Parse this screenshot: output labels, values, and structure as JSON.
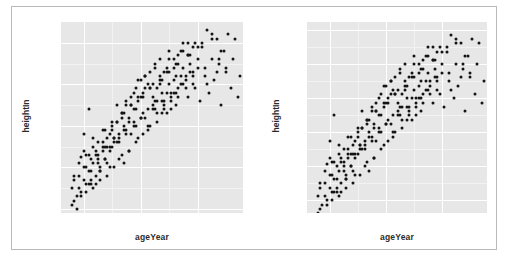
{
  "figure": {
    "background": "#ffffff",
    "border_color": "#b9b9b9",
    "panel_fill": "#e7e7e7",
    "grid_color": "#ffffff",
    "point_color": "#141414"
  },
  "chart_data": [
    {
      "type": "scatter",
      "title": "",
      "xlabel": "ageYear",
      "ylabel": "heightIn",
      "xlim": [
        11.2,
        17.6
      ],
      "ylim": [
        49.5,
        72.5
      ],
      "xticks": [
        12,
        14,
        16
      ],
      "xtick_labels": [
        "12",
        "14",
        "16"
      ],
      "yticks": [
        50,
        55,
        60,
        65,
        70
      ],
      "ytick_labels": [
        "4'2\"",
        "4'7\"",
        "5'0\"",
        "5'5\"",
        "5'10\""
      ],
      "grid": true,
      "legend": "none",
      "x": [
        11.92,
        12.0,
        12.08,
        12.17,
        12.25,
        12.33,
        12.42,
        12.5,
        12.58,
        12.67,
        12.75,
        12.83,
        12.92,
        13.0,
        13.08,
        13.17,
        13.25,
        13.33,
        13.42,
        13.5,
        13.58,
        13.67,
        13.75,
        13.83,
        13.92,
        14.0,
        14.08,
        14.17,
        14.25,
        14.33,
        14.42,
        14.5,
        14.58,
        14.67,
        14.75,
        14.83,
        14.92,
        15.0,
        15.08,
        15.17,
        15.25,
        15.33,
        15.42,
        15.5,
        15.58,
        15.67,
        15.75,
        15.83,
        15.92,
        16.0,
        16.08,
        16.17,
        16.25,
        16.33,
        16.42,
        16.5,
        16.58,
        16.67,
        16.75,
        16.83,
        16.92,
        17.0,
        17.08,
        17.17,
        17.25,
        17.33,
        17.42,
        17.5,
        11.58,
        11.67,
        11.75,
        11.83,
        11.92,
        12.0,
        12.08,
        12.17,
        12.25,
        12.33,
        12.42,
        12.5,
        12.58,
        12.67,
        12.75,
        12.83,
        12.92,
        13.0,
        13.08,
        13.17,
        13.25,
        13.33,
        13.42,
        13.5,
        13.58,
        13.67,
        13.75,
        13.83,
        13.92,
        14.0,
        14.08,
        14.17,
        14.25,
        14.33,
        14.42,
        14.5,
        14.58,
        14.67,
        14.75,
        14.83,
        14.92,
        15.0,
        15.08,
        15.17,
        15.25,
        15.33,
        15.42,
        15.5,
        15.58,
        15.67,
        15.75,
        15.83,
        11.58,
        11.67,
        11.75,
        11.83,
        11.92,
        12.0,
        12.08,
        12.17,
        12.25,
        12.33,
        12.42,
        12.5,
        12.58,
        12.67,
        12.75,
        12.83,
        12.92,
        13.0,
        13.08,
        13.17,
        13.25,
        13.33,
        13.42,
        13.5,
        13.58,
        13.67,
        13.75,
        13.83,
        13.92,
        14.0,
        14.08,
        14.17,
        14.25,
        14.33,
        14.42,
        14.5,
        14.58,
        14.67,
        14.75,
        14.83,
        14.92,
        15.0,
        15.08,
        15.17,
        15.25,
        15.33,
        15.42,
        15.5,
        15.58,
        15.67,
        15.75,
        15.83,
        15.92,
        16.0,
        16.17,
        16.33,
        16.5,
        16.67,
        16.83,
        17.0,
        11.67,
        11.83,
        12.0,
        12.17,
        12.33,
        12.5,
        12.67,
        12.83,
        13.0,
        13.17,
        13.33,
        13.5,
        13.67,
        13.83,
        14.0,
        14.17,
        14.33,
        14.5,
        14.67,
        14.83,
        15.0,
        15.17,
        15.33,
        15.5,
        15.67,
        15.83,
        16.0,
        16.25,
        16.5,
        16.75,
        12.08,
        12.25,
        12.42,
        12.58,
        12.75,
        12.92,
        13.08,
        13.25,
        13.42,
        13.58,
        13.75,
        13.92,
        14.08,
        14.25,
        14.42,
        14.58,
        14.75,
        14.92,
        15.08,
        15.25
      ],
      "y": [
        56.3,
        59.0,
        56.5,
        62.0,
        56.0,
        57.5,
        53.0,
        58.0,
        54.5,
        57.0,
        59.5,
        55.5,
        57.5,
        60.0,
        58.5,
        62.5,
        58.0,
        61.0,
        55.5,
        63.0,
        60.5,
        59.0,
        64.0,
        62.0,
        65.5,
        61.0,
        63.5,
        66.0,
        60.0,
        64.5,
        62.5,
        67.0,
        63.0,
        65.0,
        61.5,
        66.5,
        64.0,
        68.0,
        62.0,
        65.5,
        67.5,
        63.5,
        66.0,
        69.0,
        64.5,
        68.5,
        66.5,
        65.0,
        70.0,
        67.0,
        63.0,
        69.5,
        66.0,
        71.5,
        64.0,
        68.0,
        65.5,
        70.5,
        67.5,
        62.5,
        69.0,
        66.5,
        71.0,
        64.5,
        68.0,
        70.5,
        63.5,
        66.0,
        52.5,
        53.5,
        51.5,
        54.0,
        52.0,
        55.0,
        53.0,
        56.5,
        54.5,
        52.5,
        57.0,
        55.5,
        53.5,
        58.0,
        56.0,
        54.0,
        59.0,
        57.5,
        55.0,
        60.5,
        58.5,
        56.5,
        61.5,
        59.5,
        57.0,
        62.5,
        60.0,
        58.0,
        63.5,
        61.0,
        59.0,
        64.5,
        62.0,
        60.0,
        65.0,
        63.0,
        61.5,
        66.0,
        64.0,
        62.5,
        67.0,
        65.0,
        63.5,
        68.0,
        66.0,
        64.5,
        69.0,
        67.0,
        65.5,
        70.0,
        68.5,
        66.5,
        50.5,
        51.0,
        50.0,
        52.5,
        51.5,
        53.5,
        52.0,
        54.5,
        53.0,
        55.5,
        54.0,
        56.5,
        55.0,
        57.5,
        56.0,
        58.5,
        57.0,
        59.5,
        58.0,
        60.5,
        59.0,
        61.5,
        60.0,
        62.5,
        61.0,
        63.5,
        62.0,
        64.5,
        63.0,
        65.5,
        64.0,
        66.0,
        65.0,
        66.5,
        63.5,
        67.5,
        64.5,
        68.0,
        65.5,
        62.0,
        66.5,
        69.0,
        63.0,
        67.0,
        64.0,
        68.5,
        65.0,
        70.0,
        66.0,
        63.5,
        67.5,
        69.5,
        64.5,
        68.0,
        70.0,
        65.0,
        71.0,
        66.5,
        69.0,
        67.0,
        54.0,
        55.5,
        57.0,
        53.0,
        58.5,
        56.0,
        59.5,
        57.5,
        60.5,
        58.0,
        61.5,
        59.0,
        62.5,
        60.0,
        63.5,
        61.0,
        64.5,
        62.0,
        65.5,
        63.0,
        66.5,
        64.0,
        67.5,
        65.0,
        68.5,
        66.0,
        69.5,
        67.0,
        70.5,
        68.0,
        55.0,
        53.5,
        56.5,
        54.5,
        57.5,
        55.0,
        58.5,
        56.0,
        59.5,
        57.0,
        60.5,
        58.5,
        61.5,
        59.5,
        62.0,
        60.5,
        63.0,
        61.5,
        64.0,
        62.5
      ]
    },
    {
      "type": "scatter",
      "title": "",
      "xlabel": "ageYear",
      "ylabel": "heightIn",
      "xlim": [
        11.2,
        17.6
      ],
      "ylim": [
        50.5,
        73.0
      ],
      "xticks": [
        12,
        14,
        16
      ],
      "xtick_labels": [
        "12",
        "14",
        "16"
      ],
      "yticks": [
        52,
        56,
        60,
        64,
        68,
        72
      ],
      "ytick_labels": [
        "4'4\"",
        "4'8\"",
        "5'0\"",
        "5'4\"",
        "5'8\"",
        "6'0\""
      ],
      "grid": true,
      "legend": "none",
      "x": [
        11.92,
        12.0,
        12.08,
        12.17,
        12.25,
        12.33,
        12.42,
        12.5,
        12.58,
        12.67,
        12.75,
        12.83,
        12.92,
        13.0,
        13.08,
        13.17,
        13.25,
        13.33,
        13.42,
        13.5,
        13.58,
        13.67,
        13.75,
        13.83,
        13.92,
        14.0,
        14.08,
        14.17,
        14.25,
        14.33,
        14.42,
        14.5,
        14.58,
        14.67,
        14.75,
        14.83,
        14.92,
        15.0,
        15.08,
        15.17,
        15.25,
        15.33,
        15.42,
        15.5,
        15.58,
        15.67,
        15.75,
        15.83,
        15.92,
        16.0,
        16.08,
        16.17,
        16.25,
        16.33,
        16.42,
        16.5,
        16.58,
        16.67,
        16.75,
        16.83,
        16.92,
        17.0,
        17.08,
        17.17,
        17.25,
        17.33,
        17.42,
        17.5,
        11.58,
        11.67,
        11.75,
        11.83,
        11.92,
        12.0,
        12.08,
        12.17,
        12.25,
        12.33,
        12.42,
        12.5,
        12.58,
        12.67,
        12.75,
        12.83,
        12.92,
        13.0,
        13.08,
        13.17,
        13.25,
        13.33,
        13.42,
        13.5,
        13.58,
        13.67,
        13.75,
        13.83,
        13.92,
        14.0,
        14.08,
        14.17,
        14.25,
        14.33,
        14.42,
        14.5,
        14.58,
        14.67,
        14.75,
        14.83,
        14.92,
        15.0,
        15.08,
        15.17,
        15.25,
        15.33,
        15.42,
        15.5,
        15.58,
        15.67,
        15.75,
        15.83,
        11.58,
        11.67,
        11.75,
        11.83,
        11.92,
        12.0,
        12.08,
        12.17,
        12.25,
        12.33,
        12.42,
        12.5,
        12.58,
        12.67,
        12.75,
        12.83,
        12.92,
        13.0,
        13.08,
        13.17,
        13.25,
        13.33,
        13.42,
        13.5,
        13.58,
        13.67,
        13.75,
        13.83,
        13.92,
        14.0,
        14.08,
        14.17,
        14.25,
        14.33,
        14.42,
        14.5,
        14.58,
        14.67,
        14.75,
        14.83,
        14.92,
        15.0,
        15.08,
        15.17,
        15.25,
        15.33,
        15.42,
        15.5,
        15.58,
        15.67,
        15.75,
        15.83,
        15.92,
        16.0,
        16.17,
        16.33,
        16.5,
        16.67,
        16.83,
        17.0,
        11.67,
        11.83,
        12.0,
        12.17,
        12.33,
        12.5,
        12.67,
        12.83,
        13.0,
        13.17,
        13.33,
        13.5,
        13.67,
        13.83,
        14.0,
        14.17,
        14.33,
        14.5,
        14.67,
        14.83,
        15.0,
        15.17,
        15.33,
        15.5,
        15.67,
        15.83,
        16.0,
        16.25,
        16.5,
        16.75,
        12.08,
        12.25,
        12.42,
        12.58,
        12.75,
        12.92,
        13.08,
        13.25,
        13.42,
        13.58,
        13.75,
        13.92,
        14.08,
        14.25,
        14.42,
        14.58,
        14.75,
        14.92,
        15.08,
        15.25
      ],
      "y": [
        56.3,
        59.0,
        56.5,
        62.0,
        56.0,
        57.5,
        53.0,
        58.0,
        54.5,
        57.0,
        59.5,
        55.5,
        57.5,
        60.0,
        58.5,
        62.5,
        58.0,
        61.0,
        55.5,
        63.0,
        60.5,
        59.0,
        64.0,
        62.0,
        65.5,
        61.0,
        63.5,
        66.0,
        60.0,
        64.5,
        62.5,
        67.0,
        63.0,
        65.0,
        61.5,
        66.5,
        64.0,
        68.0,
        62.0,
        65.5,
        67.5,
        63.5,
        66.0,
        69.0,
        64.5,
        68.5,
        66.5,
        65.0,
        70.0,
        67.0,
        63.0,
        69.5,
        66.0,
        71.5,
        64.0,
        68.0,
        65.5,
        70.5,
        67.5,
        62.5,
        69.0,
        66.5,
        71.0,
        64.5,
        68.0,
        70.5,
        63.5,
        66.0,
        52.5,
        53.5,
        51.5,
        54.0,
        52.0,
        55.0,
        53.0,
        56.5,
        54.5,
        52.5,
        57.0,
        55.5,
        53.5,
        58.0,
        56.0,
        54.0,
        59.0,
        57.5,
        55.0,
        60.5,
        58.5,
        56.5,
        61.5,
        59.5,
        57.0,
        62.5,
        60.0,
        58.0,
        63.5,
        61.0,
        59.0,
        64.5,
        62.0,
        60.0,
        65.0,
        63.0,
        61.5,
        66.0,
        64.0,
        62.5,
        67.0,
        65.0,
        63.5,
        68.0,
        66.0,
        64.5,
        69.0,
        67.0,
        65.5,
        70.0,
        68.5,
        66.5,
        50.5,
        51.0,
        50.0,
        52.5,
        51.5,
        53.5,
        52.0,
        54.5,
        53.0,
        55.5,
        54.0,
        56.5,
        55.0,
        57.5,
        56.0,
        58.5,
        57.0,
        59.5,
        58.0,
        60.5,
        59.0,
        61.5,
        60.0,
        62.5,
        61.0,
        63.5,
        62.0,
        64.5,
        63.0,
        65.5,
        64.0,
        66.0,
        65.0,
        66.5,
        63.5,
        67.5,
        64.5,
        68.0,
        65.5,
        62.0,
        66.5,
        69.0,
        63.0,
        67.0,
        64.0,
        68.5,
        65.0,
        70.0,
        66.0,
        63.5,
        67.5,
        69.5,
        64.5,
        68.0,
        70.0,
        65.0,
        71.0,
        66.5,
        69.0,
        67.0,
        54.0,
        55.5,
        57.0,
        53.0,
        58.5,
        56.0,
        59.5,
        57.5,
        60.5,
        58.0,
        61.5,
        59.0,
        62.5,
        60.0,
        63.5,
        61.0,
        64.5,
        62.0,
        65.5,
        63.0,
        66.5,
        64.0,
        67.5,
        65.0,
        68.5,
        66.0,
        69.5,
        67.0,
        70.5,
        68.0,
        55.0,
        53.5,
        56.5,
        54.5,
        57.5,
        55.0,
        58.5,
        56.0,
        59.5,
        57.0,
        60.5,
        58.5,
        61.5,
        59.5,
        62.0,
        60.5,
        63.0,
        61.5,
        64.0,
        62.5
      ]
    }
  ]
}
